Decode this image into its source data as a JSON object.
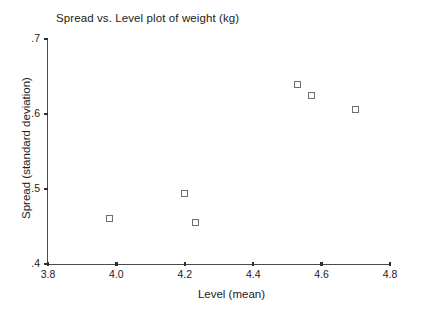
{
  "chart_data": {
    "type": "scatter",
    "title": "Spread vs. Level plot of weight (kg)",
    "xlabel": "Level (mean)",
    "ylabel": "Spread (standard deviation)",
    "xlim": [
      3.8,
      4.8
    ],
    "ylim": [
      0.4,
      0.7
    ],
    "xticks": [
      3.8,
      4.0,
      4.2,
      4.4,
      4.6,
      4.8
    ],
    "xticklabels": [
      "3.8",
      "4.0",
      "4.2",
      "4.4",
      "4.6",
      "4.8"
    ],
    "yticks": [
      0.4,
      0.5,
      0.6,
      0.7
    ],
    "yticklabels": [
      ".4",
      ".5",
      ".6",
      ".7"
    ],
    "grid": false,
    "legend": null,
    "marker_style": "open-square",
    "marker_color": "#6e6e6e",
    "points": [
      {
        "x": 3.98,
        "y": 0.461
      },
      {
        "x": 4.2,
        "y": 0.494
      },
      {
        "x": 4.23,
        "y": 0.455
      },
      {
        "x": 4.53,
        "y": 0.639
      },
      {
        "x": 4.57,
        "y": 0.625
      },
      {
        "x": 4.7,
        "y": 0.606
      }
    ]
  },
  "axis_title_color": "#1c1c1c",
  "background": "#ffffff"
}
